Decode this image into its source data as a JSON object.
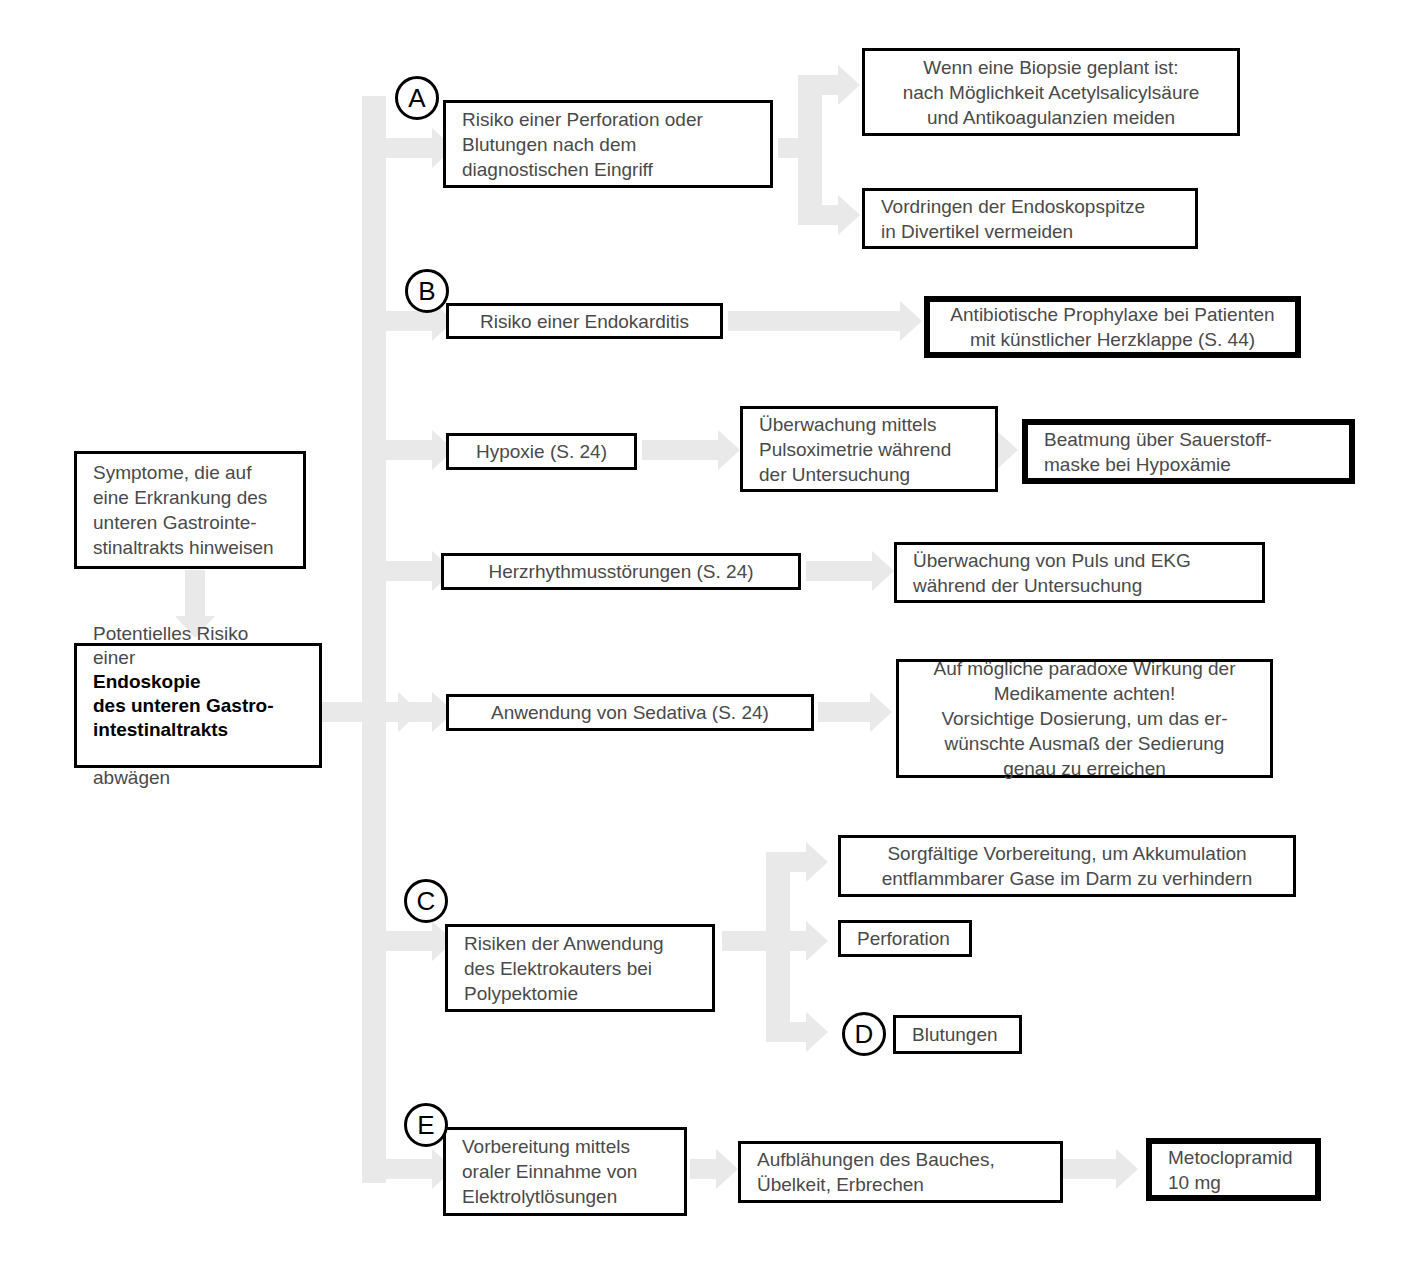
{
  "diagram": {
    "connector_color": "#e9e9e9",
    "border_color": "#000000",
    "text_color": "#4a4a4a"
  },
  "markers": {
    "a": "A",
    "b": "B",
    "c": "C",
    "d": "D",
    "e": "E"
  },
  "left_column": {
    "symptoms": "Symptome, die auf\neine Erkrankung des\nunteren Gastrointe-\nstinaltrakts hinweisen",
    "risk_intro": "Potentielles Risiko\neiner ",
    "risk_bold": "Endoskopie\ndes unteren Gastro-\nintestinaltrakts",
    "risk_outro": "\nabwägen"
  },
  "rows": {
    "a": {
      "risk": "Risiko einer Perforation oder\nBlutungen nach dem\ndiagnostischen Eingriff",
      "action_1": "Wenn eine Biopsie geplant ist:\nnach Möglichkeit Acetylsalicylsäure\nund  Antikoagulanzien meiden",
      "action_2": "Vordringen der Endoskopspitze\nin Divertikel vermeiden"
    },
    "b": {
      "risk": "Risiko einer Endokarditis",
      "action_1": "Antibiotische Prophylaxe bei Patienten\nmit künstlicher Herzklappe (S. 44)"
    },
    "hypoxie": {
      "risk": "Hypoxie (S. 24)",
      "action_1": "Überwachung mittels\nPulsoximetrie während\nder Untersuchung",
      "action_2": "Beatmung über Sauerstoff-\nmaske bei Hypoxämie"
    },
    "arrhythmia": {
      "risk": "Herzrhythmusstörungen (S. 24)",
      "action_1": "Überwachung von Puls und EKG\nwährend der Untersuchung"
    },
    "sedativa": {
      "risk": "Anwendung von Sedativa (S. 24)",
      "action_1": "Auf mögliche paradoxe Wirkung der\nMedikamente achten!\nVorsichtige Dosierung, um das er-\nwünschte Ausmaß der Sedierung\ngenau zu erreichen"
    },
    "c": {
      "risk": "Risiken der Anwendung\ndes Elektrokauters bei\nPolypektomie",
      "action_1": "Sorgfältige Vorbereitung, um Akkumulation\nentflammbarer Gase im Darm zu verhindern",
      "action_2": "Perforation",
      "action_3": "Blutungen"
    },
    "e": {
      "risk": "Vorbereitung mittels\noraler Einnahme von\nElektrolytlösungen",
      "action_1": "Aufblähungen des Bauches,\nÜbelkeit, Erbrechen",
      "action_2": "Metoclopramid\n10 mg"
    }
  }
}
